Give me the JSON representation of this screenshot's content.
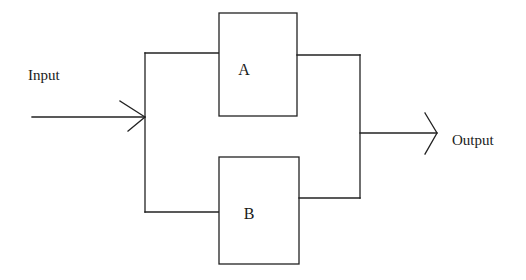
{
  "diagram": {
    "type": "parallel block diagram",
    "input_label": "Input",
    "output_label": "Output",
    "blocks": [
      {
        "id": "A",
        "label": "A"
      },
      {
        "id": "B",
        "label": "B"
      }
    ],
    "connections": [
      {
        "from": "Input",
        "to": "A"
      },
      {
        "from": "Input",
        "to": "B"
      },
      {
        "from": "A",
        "to": "Output"
      },
      {
        "from": "B",
        "to": "Output"
      }
    ],
    "colors": {
      "line": "#222222",
      "background": "#ffffff"
    }
  }
}
